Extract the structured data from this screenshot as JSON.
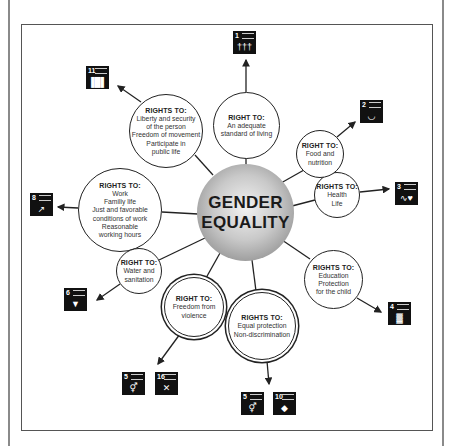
{
  "diagram": {
    "center": {
      "line1": "GENDER",
      "line2": "EQUALITY"
    },
    "nodes": [
      {
        "id": "adequate-standard",
        "heading": "RIGHT TO:",
        "lines": [
          "An adequate",
          "standard of living"
        ],
        "sdgs": [
          "1"
        ]
      },
      {
        "id": "liberty",
        "heading": "RIGHTS TO:",
        "lines": [
          "Liberty and security",
          "of the person",
          "Freedom of movement",
          "Participate in",
          "public life"
        ],
        "sdgs": [
          "11"
        ]
      },
      {
        "id": "work",
        "heading": "RIGHTS TO:",
        "lines": [
          "Work",
          "Familiy life",
          "Just and favorable",
          "conditions of work",
          "Reasonable",
          "working hours"
        ],
        "sdgs": [
          "8"
        ]
      },
      {
        "id": "water",
        "heading": "RIGHT TO:",
        "lines": [
          "Water and",
          "sanitation"
        ],
        "sdgs": [
          "6"
        ]
      },
      {
        "id": "violence",
        "heading": "RIGHT TO:",
        "lines": [
          "Freedom from",
          "violence"
        ],
        "sdgs": [
          "5",
          "16"
        ]
      },
      {
        "id": "equal-protection",
        "heading": "RIGHTS TO:",
        "lines": [
          "Equal protection",
          "Non-discrimination"
        ],
        "sdgs": [
          "5",
          "10"
        ]
      },
      {
        "id": "education",
        "heading": "RIGHTS TO:",
        "lines": [
          "Education",
          "Protection",
          "for the child"
        ],
        "sdgs": [
          "4"
        ]
      },
      {
        "id": "health",
        "heading": "RIGHTS TO:",
        "lines": [
          "Health",
          "Life"
        ],
        "sdgs": [
          "3"
        ]
      },
      {
        "id": "food",
        "heading": "RIGHT TO:",
        "lines": [
          "Food and",
          "nutrition"
        ],
        "sdgs": [
          "2"
        ]
      }
    ],
    "sdg_icons": [
      {
        "number": "1",
        "icon": "family-icon",
        "glyph": "†††"
      },
      {
        "number": "11",
        "icon": "city-buildings-icon",
        "glyph": "▐█▌"
      },
      {
        "number": "2",
        "icon": "food-bowl-icon",
        "glyph": "◡"
      },
      {
        "number": "3",
        "icon": "heartbeat-icon",
        "glyph": "∿♥"
      },
      {
        "number": "8",
        "icon": "growth-chart-icon",
        "glyph": "↗"
      },
      {
        "number": "6",
        "icon": "water-drop-icon",
        "glyph": "▼"
      },
      {
        "number": "4",
        "icon": "open-book-icon",
        "glyph": "▓"
      },
      {
        "number": "5",
        "icon": "gender-symbol-icon",
        "glyph": "⚥"
      },
      {
        "number": "16",
        "icon": "dove-peace-icon",
        "glyph": "✕"
      },
      {
        "number": "5",
        "icon": "gender-symbol-icon",
        "glyph": "⚥"
      },
      {
        "number": "10",
        "icon": "reduced-inequalities-icon",
        "glyph": "◆"
      }
    ]
  },
  "colors": {
    "line": "#222222",
    "sdg_bg": "#111111",
    "sphere_light": "#f2f2f2",
    "sphere_dark": "#7a7a7a"
  }
}
